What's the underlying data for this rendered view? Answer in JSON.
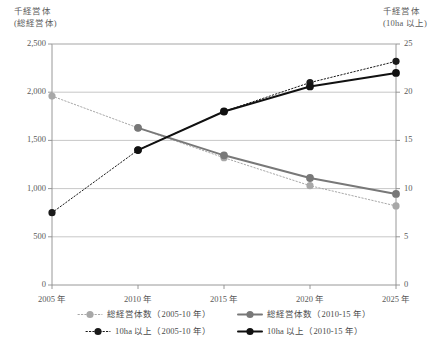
{
  "axes": {
    "left_title_line1": "千経営体",
    "left_title_line2": "(総経営体)",
    "right_title_line1": "千経営体",
    "right_title_line2": "(10ha 以上)",
    "left_ticks": [
      "2,500",
      "2,000",
      "1,500",
      "1,000",
      "500",
      "0"
    ],
    "right_ticks": [
      "25",
      "20",
      "15",
      "10",
      "5",
      "0"
    ],
    "x_ticks": [
      "2005 年",
      "2010 年",
      "2015 年",
      "2020 年",
      "2025 年"
    ]
  },
  "legend": {
    "rows": [
      [
        {
          "label": "総経営体数（2005-10 年）",
          "color": "#a8a8a8",
          "style": "dotted",
          "name": "legend-total-2005-10"
        },
        {
          "label": "総経営体数（2010-15 年）",
          "color": "#787878",
          "style": "solid",
          "name": "legend-total-2010-15"
        }
      ],
      [
        {
          "label": "10ha 以上（2005-10 年）",
          "color": "#1a1a1a",
          "style": "dotted",
          "name": "legend-10ha-2005-10"
        },
        {
          "label": "10ha 以上（2010-15 年）",
          "color": "#111111",
          "style": "solid",
          "name": "legend-10ha-2010-15"
        }
      ]
    ]
  },
  "chart_data": {
    "type": "line",
    "title": "",
    "xlabel": "",
    "ylabel": "千経営体（総経営体）",
    "y2label": "千経営体（10ha 以上）",
    "x": [
      "2005 年",
      "2010 年",
      "2015 年",
      "2020 年",
      "2025 年"
    ],
    "ylim": [
      0,
      2500
    ],
    "y2lim": [
      0,
      25
    ],
    "grid": "horizontal",
    "legend_position": "bottom",
    "series": [
      {
        "name": "総経営体数（2005-10 年）",
        "axis": "left",
        "color": "#a8a8a8",
        "style": "dotted",
        "values": [
          1960,
          1630,
          1320,
          1030,
          820
        ]
      },
      {
        "name": "総経営体数（2010-15 年）",
        "axis": "left",
        "color": "#787878",
        "style": "solid",
        "values": [
          null,
          1630,
          1345,
          1110,
          945
        ]
      },
      {
        "name": "10ha 以上（2005-10 年）",
        "axis": "right",
        "color": "#1a1a1a",
        "style": "dotted",
        "values": [
          7.5,
          14.0,
          18.0,
          21.0,
          23.2
        ]
      },
      {
        "name": "10ha 以上（2010-15 年）",
        "axis": "right",
        "color": "#111111",
        "style": "solid",
        "values": [
          null,
          14.0,
          18.0,
          20.6,
          22.0
        ]
      }
    ]
  },
  "plot_geometry": {
    "left": 52,
    "right": 396,
    "top": 44,
    "bottom": 285
  }
}
